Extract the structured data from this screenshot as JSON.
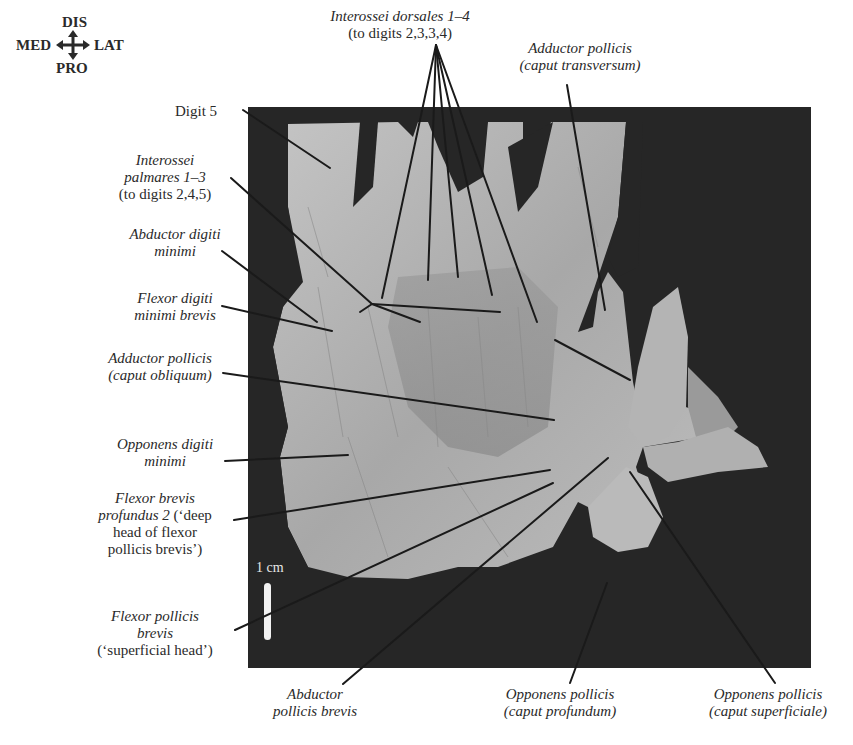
{
  "orientation": {
    "top": "DIS",
    "left": "MED",
    "right": "LAT",
    "bottom": "PRO",
    "glyph": "four-way-arrow-icon"
  },
  "scale_bar": {
    "label": "1 cm"
  },
  "labels": {
    "digit5": {
      "line1": "Digit 5"
    },
    "interossei_dorsales": {
      "line1": "Interossei dorsales 1–4",
      "line2": "(to digits 2,3,3,4)"
    },
    "adductor_transversum": {
      "line1": "Adductor pollicis",
      "line2": "(caput transversum)"
    },
    "interossei_palmares": {
      "line1": "Interossei",
      "line2": "palmares 1–3",
      "line3": "(to digits 2,4,5)"
    },
    "abductor_digiti_minimi": {
      "line1": "Abductor digiti",
      "line2": "minimi"
    },
    "flexor_digiti_minimi": {
      "line1": "Flexor digiti",
      "line2": "minimi brevis"
    },
    "adductor_obliquum": {
      "line1": "Adductor pollicis",
      "line2": "(caput obliquum)"
    },
    "opponens_digiti_minimi": {
      "line1": "Opponens digiti",
      "line2": "minimi"
    },
    "flexor_brevis_profundus": {
      "line1": "Flexor brevis",
      "line2a": "profundus 2",
      "line2b": " (‘deep",
      "line3": "head of flexor",
      "line4": "pollicis brevis’)"
    },
    "flexor_pollicis_brevis": {
      "line1": "Flexor pollicis",
      "line2": "brevis",
      "line3": "(‘superficial head’)"
    },
    "abductor_pollicis_brevis": {
      "line1": "Abductor",
      "line2": "pollicis brevis"
    },
    "opponens_profundum": {
      "line1": "Opponens pollicis",
      "line2": "(caput profundum)"
    },
    "opponens_superficiale": {
      "line1": "Opponens pollicis",
      "line2": "(caput superficiale)"
    }
  },
  "colors": {
    "background": "#ffffff",
    "photo_background": "#262626",
    "tissue": "#b8b8b8",
    "leader_line": "#1a1a1a",
    "text": "#2a2a2a"
  }
}
